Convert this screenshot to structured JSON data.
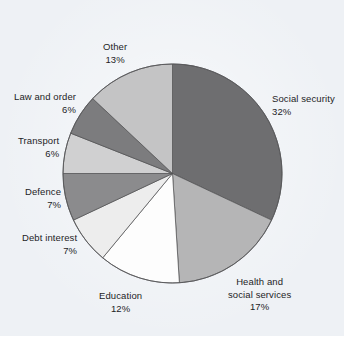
{
  "figure": {
    "background_color": "#eef1f5",
    "page_color": "#ffffff"
  },
  "chart_data": {
    "type": "pie",
    "title": "",
    "subtitle": "",
    "xlabel": "",
    "ylabel": "",
    "legend_position": "none",
    "grid": false,
    "label_format": "name + percent",
    "start_angle_deg": 0,
    "direction": "clockwise",
    "total_percent": 100,
    "categories": [
      "Social security",
      "Health and social services",
      "Education",
      "Debt interest",
      "Defence",
      "Transport",
      "Law and order",
      "Other"
    ],
    "values": [
      32,
      17,
      12,
      7,
      7,
      6,
      6,
      13
    ],
    "slices": [
      {
        "name": "Social security",
        "label_line1": "Social security",
        "label_line2": "",
        "value": 32,
        "value_label": "32%",
        "color": "#6e6e70",
        "label_align": "left"
      },
      {
        "name": "Health and social services",
        "label_line1": "Health and",
        "label_line2": "social services",
        "value": 17,
        "value_label": "17%",
        "color": "#b5b5b6",
        "label_align": "center"
      },
      {
        "name": "Education",
        "label_line1": "Education",
        "label_line2": "",
        "value": 12,
        "value_label": "12%",
        "color": "#fdfdfd",
        "label_align": "center"
      },
      {
        "name": "Debt interest",
        "label_line1": "Debt interest",
        "label_line2": "",
        "value": 7,
        "value_label": "7%",
        "color": "#ededed",
        "label_align": "right"
      },
      {
        "name": "Defence",
        "label_line1": "Defence",
        "label_line2": "",
        "value": 7,
        "value_label": "7%",
        "color": "#8b8b8d",
        "label_align": "right"
      },
      {
        "name": "Transport",
        "label_line1": "Transport",
        "label_line2": "",
        "value": 6,
        "value_label": "6%",
        "color": "#d0d0d1",
        "label_align": "right"
      },
      {
        "name": "Law and order",
        "label_line1": "Law and order",
        "label_line2": "",
        "value": 6,
        "value_label": "6%",
        "color": "#7c7c7e",
        "label_align": "right"
      },
      {
        "name": "Other",
        "label_line1": "Other",
        "label_line2": "",
        "value": 13,
        "value_label": "13%",
        "color": "#c4c4c5",
        "label_align": "center"
      }
    ]
  }
}
